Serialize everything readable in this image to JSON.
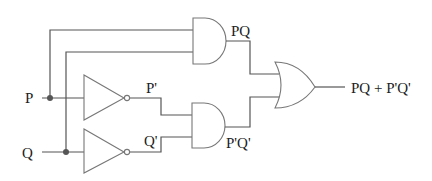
{
  "diagram": {
    "type": "logic-circuit",
    "inputs": [
      {
        "id": "P",
        "label": "P"
      },
      {
        "id": "Q",
        "label": "Q"
      }
    ],
    "gates": [
      {
        "id": "not_p",
        "type": "NOT",
        "input": "P",
        "output_label": "P'"
      },
      {
        "id": "not_q",
        "type": "NOT",
        "input": "Q",
        "output_label": "Q'"
      },
      {
        "id": "and_top",
        "type": "AND",
        "inputs": [
          "P",
          "Q"
        ],
        "output_label": "PQ"
      },
      {
        "id": "and_bottom",
        "type": "AND",
        "inputs": [
          "P'",
          "Q'"
        ],
        "output_label": "P'Q'"
      },
      {
        "id": "or_out",
        "type": "OR",
        "inputs": [
          "PQ",
          "P'Q'"
        ],
        "output_label": "PQ + P'Q'"
      }
    ],
    "labels": {
      "input_p": "P",
      "input_q": "Q",
      "not_p_out": "P'",
      "not_q_out": "Q'",
      "and_top_out": "PQ",
      "and_bottom_out": "P'Q'",
      "output": "PQ + P'Q'"
    }
  }
}
